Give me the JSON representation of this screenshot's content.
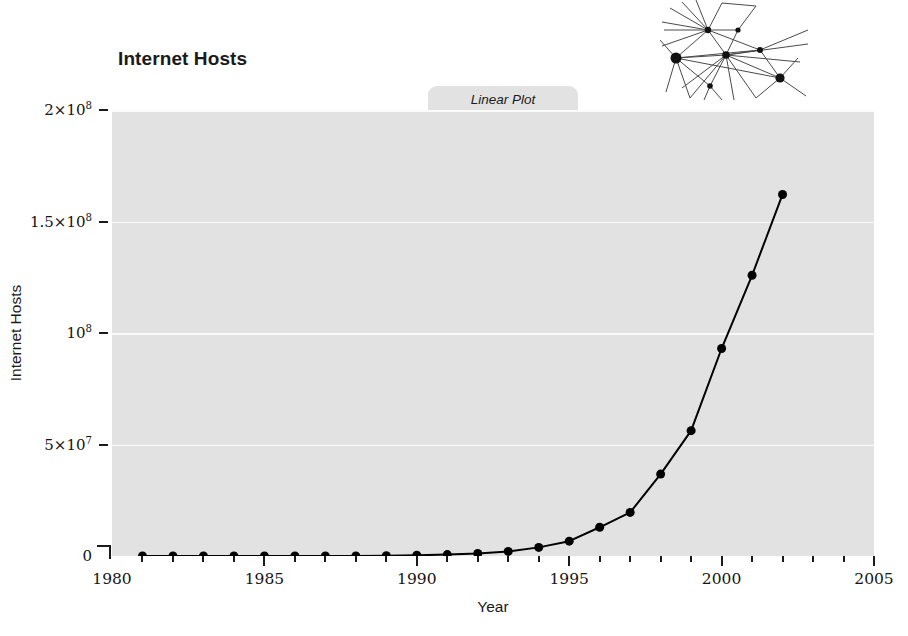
{
  "chart_data": {
    "type": "line",
    "title": "Internet Hosts",
    "xlabel": "Year",
    "ylabel": "Internet Hosts",
    "xlim": [
      1980,
      2005
    ],
    "ylim": [
      0,
      200000000
    ],
    "grid": true,
    "legend": "none",
    "tab_label": "Linear Plot",
    "x": [
      1981,
      1982,
      1983,
      1984,
      1985,
      1986,
      1987,
      1988,
      1989,
      1990,
      1991,
      1992,
      1993,
      1994,
      1995,
      1996,
      1997,
      1998,
      1999,
      2000,
      2001,
      2002
    ],
    "values": [
      213,
      235,
      562,
      1024,
      1961,
      5089,
      28174,
      56000,
      159000,
      313000,
      617000,
      1136000,
      2056000,
      3864000,
      6642000,
      12881000,
      19540000,
      36739000,
      56218000,
      93047000,
      125888000,
      162128000
    ],
    "series": [
      {
        "name": "Internet Hosts",
        "values": [
          213,
          235,
          562,
          1024,
          1961,
          5089,
          28174,
          56000,
          159000,
          313000,
          617000,
          1136000,
          2056000,
          3864000,
          6642000,
          12881000,
          19540000,
          36739000,
          56218000,
          93047000,
          125888000,
          162128000
        ]
      }
    ],
    "ytick_values": [
      0,
      50000000,
      100000000,
      150000000,
      200000000
    ],
    "ytick_labels": [
      {
        "mantissa": "0",
        "exponent": ""
      },
      {
        "mantissa": "5×10",
        "exponent": "7"
      },
      {
        "mantissa": "10",
        "exponent": "8"
      },
      {
        "mantissa": "1.5×10",
        "exponent": "8"
      },
      {
        "mantissa": "2×10",
        "exponent": "8"
      }
    ],
    "xtick_major_values": [
      1980,
      1985,
      1990,
      1995,
      2000,
      2005
    ],
    "xtick_major_labels": [
      "1980",
      "1985",
      "1990",
      "1995",
      "2000",
      "2005"
    ],
    "xtick_minor_values": [
      1981,
      1982,
      1983,
      1984,
      1986,
      1987,
      1988,
      1989,
      1991,
      1992,
      1993,
      1994,
      1996,
      1997,
      1998,
      1999,
      2001,
      2002,
      2003,
      2004
    ],
    "colors": {
      "plot_background": "#e2e2e2",
      "gridline": "#fbfbfb",
      "line": "#000000",
      "marker": "#000000",
      "text": "#1a1a1a",
      "tab_background": "#e2e2e2"
    },
    "marker": "filled-circle",
    "marker_size": 9,
    "line_width": 2
  },
  "decoration": {
    "network_icon": "network-graph-icon",
    "nodes": [
      {
        "x": 0.32,
        "y": 0.3,
        "r": 3.2
      },
      {
        "x": 0.52,
        "y": 0.3,
        "r": 2.6
      },
      {
        "x": 0.12,
        "y": 0.58,
        "r": 5.5
      },
      {
        "x": 0.45,
        "y": 0.55,
        "r": 3.8
      },
      {
        "x": 0.67,
        "y": 0.5,
        "r": 3.0
      },
      {
        "x": 0.8,
        "y": 0.78,
        "r": 4.6
      },
      {
        "x": 0.33,
        "y": 0.85,
        "r": 2.8
      }
    ],
    "line_color": "#4a4a4a",
    "node_color": "#111111"
  }
}
